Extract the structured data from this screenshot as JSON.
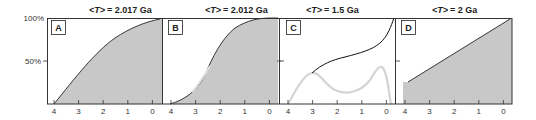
{
  "chart_data": [
    {
      "type": "area",
      "panel": "A",
      "title": "<T> = 2.017 Ga",
      "title_parts": {
        "var": "T",
        "value": "= 2.017 Ga"
      },
      "xlabel": "",
      "ylabel": "",
      "x_ticks": [
        "4",
        "3",
        "2",
        "1",
        "0"
      ],
      "y_ticks": [
        "50%",
        "100%"
      ],
      "xlim": [
        4,
        0
      ],
      "ylim": [
        0,
        100
      ],
      "series": [
        {
          "name": "cumulative",
          "x": [
            4,
            3.5,
            3,
            2.5,
            2,
            1.5,
            1,
            0.5,
            0
          ],
          "values": [
            0,
            17,
            34,
            50,
            64,
            77,
            88,
            96,
            100
          ]
        }
      ],
      "fill": "#c8c8c8"
    },
    {
      "type": "area",
      "panel": "B",
      "title": "<T> = 2.012 Ga",
      "title_parts": {
        "var": "T",
        "value": "= 2.012 Ga"
      },
      "x_ticks": [
        "4",
        "3",
        "2",
        "1",
        "0"
      ],
      "xlim": [
        4,
        0
      ],
      "ylim": [
        0,
        100
      ],
      "series": [
        {
          "name": "cumulative",
          "x": [
            4,
            3.5,
            3,
            2.5,
            2,
            1.5,
            1,
            0.5,
            0
          ],
          "values": [
            0,
            6,
            22,
            50,
            78,
            93,
            98,
            100,
            100
          ]
        },
        {
          "name": "overlay",
          "x": [
            3.2,
            2.5
          ],
          "values": [
            16,
            50
          ],
          "color": "#d8d8d8"
        }
      ],
      "fill": "#c8c8c8"
    },
    {
      "type": "line",
      "panel": "C",
      "title": "<T> = 1.5 Ga",
      "title_parts": {
        "var": "T",
        "value": "= 1.5 Ga"
      },
      "x_ticks": [
        "4",
        "3",
        "2",
        "1",
        "0"
      ],
      "xlim": [
        4,
        0
      ],
      "ylim": [
        0,
        100
      ],
      "series": [
        {
          "name": "cumulative",
          "x": [
            3,
            2.5,
            2,
            1.5,
            1,
            0.5,
            0,
            -0.3
          ],
          "values": [
            36,
            46,
            51,
            55,
            60,
            68,
            83,
            100
          ],
          "color": "#111111"
        },
        {
          "name": "distribution",
          "x": [
            4,
            3.5,
            3,
            2.5,
            2,
            1.5,
            1,
            0.5,
            0.3,
            0,
            -0.2
          ],
          "values": [
            0,
            26,
            36,
            26,
            16,
            14,
            18,
            32,
            38,
            20,
            0
          ],
          "color": "#d0d0d0"
        }
      ]
    },
    {
      "type": "area",
      "panel": "D",
      "title": "<T> = 2 Ga",
      "title_parts": {
        "var": "T",
        "value": "= 2 Ga"
      },
      "x_ticks": [
        "4",
        "3",
        "2",
        "1",
        "0"
      ],
      "xlim": [
        4,
        0
      ],
      "ylim": [
        0,
        100
      ],
      "series": [
        {
          "name": "cumulative",
          "x": [
            4,
            0
          ],
          "values": [
            25,
            100
          ]
        }
      ],
      "fill": "#c8c8c8"
    }
  ],
  "axis": {
    "y_top_label": "100%",
    "y_mid_label": "50%"
  },
  "panels": [
    {
      "letter": "A",
      "title_var": "<T>",
      "title_value": "= 2.017 Ga"
    },
    {
      "letter": "B",
      "title_var": "<T>",
      "title_value": "= 2.012 Ga"
    },
    {
      "letter": "C",
      "title_var": "<T>",
      "title_value": "= 1.5 Ga"
    },
    {
      "letter": "D",
      "title_var": "<T>",
      "title_value": "= 2 Ga"
    }
  ],
  "x_ticks": [
    "4",
    "3",
    "2",
    "1",
    "0"
  ],
  "colors": {
    "fill": "#c8c8c8",
    "line": "#111111",
    "light_line": "#d0d0d0",
    "frame": "#333333"
  }
}
